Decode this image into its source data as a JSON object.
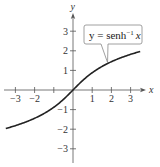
{
  "chart_data": {
    "type": "line",
    "title": "",
    "xlabel": "x",
    "ylabel": "y",
    "xlim": [
      -3.5,
      3.5
    ],
    "ylim": [
      -3.5,
      3.5
    ],
    "grid": false,
    "x_ticks": [
      -3,
      -2,
      -1,
      1,
      2,
      3
    ],
    "x_tick_labels": [
      "−3",
      "−2",
      "",
      "1",
      "2",
      "3"
    ],
    "y_ticks": [
      -3,
      -2,
      -1,
      1,
      2,
      3
    ],
    "y_tick_labels": [
      "−3",
      "−2",
      "−1",
      "1",
      "2",
      "3"
    ],
    "series": [
      {
        "name": "y = senh⁻¹ x",
        "function": "asinh",
        "x": [
          -3.5,
          -3,
          -2.5,
          -2,
          -1.5,
          -1,
          -0.5,
          0,
          0.5,
          1,
          1.5,
          2,
          2.5,
          3,
          3.5
        ],
        "values": [
          -1.97,
          -1.82,
          -1.65,
          -1.44,
          -1.19,
          -0.88,
          -0.48,
          0,
          0.48,
          0.88,
          1.19,
          1.44,
          1.65,
          1.82,
          1.97
        ]
      }
    ],
    "annotations": [
      {
        "text_main": "y = senh",
        "text_sup": "−1",
        "text_var": "x",
        "points_to_x": 1.8
      }
    ]
  },
  "style": {
    "axis_color": "#555555",
    "curve_color": "#222222",
    "label_box_border": "#888888"
  }
}
